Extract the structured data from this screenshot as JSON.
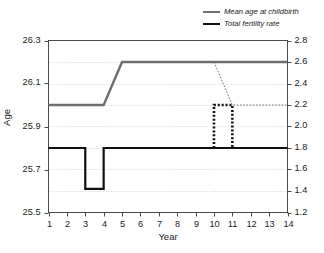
{
  "chart_data": {
    "type": "line",
    "title": "",
    "xlabel": "Year",
    "ylabel": "Age",
    "ylabel_right": "",
    "x": [
      1,
      2,
      3,
      4,
      5,
      6,
      7,
      8,
      9,
      10,
      11,
      12,
      13,
      14
    ],
    "xlim": [
      1,
      14
    ],
    "xticks": [
      "1",
      "2",
      "3",
      "4",
      "5",
      "6",
      "7",
      "8",
      "9",
      "10",
      "11",
      "12",
      "13",
      "14"
    ],
    "ylim": [
      25.5,
      26.3
    ],
    "yticks": [
      "25.5",
      "25.7",
      "25.9",
      "26.1",
      "26.3"
    ],
    "ylim_right": [
      1.2,
      2.8
    ],
    "yticks_right": [
      "1.2",
      "1.4",
      "1.6",
      "1.8",
      "2.0",
      "2.2",
      "2.4",
      "2.6",
      "2.8"
    ],
    "grid": true,
    "legend_position": "top-right",
    "series": [
      {
        "name": "Mean age at childbirth",
        "axis": "left",
        "color": "#6e6e6e",
        "style": "solid",
        "values": [
          26.0,
          26.0,
          26.0,
          26.0,
          26.2,
          26.2,
          26.2,
          26.2,
          26.2,
          26.2,
          26.2,
          26.2,
          26.2,
          26.2
        ]
      },
      {
        "name": "Total fertility rate",
        "axis": "right",
        "color": "#111111",
        "style": "solid",
        "values": [
          1.8,
          1.8,
          1.8,
          1.42,
          1.8,
          1.8,
          1.8,
          1.8,
          1.8,
          1.8,
          1.8,
          1.8,
          1.8,
          1.8
        ]
      }
    ],
    "annotations": [
      {
        "name": "mean-age-dashed-branch",
        "color": "#6e6e6e",
        "style": "dashed",
        "axis": "right",
        "points": [
          [
            10,
            2.6
          ],
          [
            11,
            2.2
          ],
          [
            14,
            2.2
          ]
        ]
      },
      {
        "name": "fertility-dotted-pulse",
        "color": "#111111",
        "style": "dotted",
        "axis": "right",
        "points": [
          [
            10,
            1.8
          ],
          [
            10,
            2.2
          ],
          [
            11,
            2.2
          ],
          [
            11,
            1.8
          ]
        ]
      }
    ]
  },
  "legend": {
    "items": [
      {
        "label": "Mean age at childbirth",
        "swatch": "gray"
      },
      {
        "label": "Total fertility rate",
        "swatch": "black"
      }
    ]
  },
  "axes": {
    "y_left_title": "Age",
    "x_title": "Year"
  }
}
